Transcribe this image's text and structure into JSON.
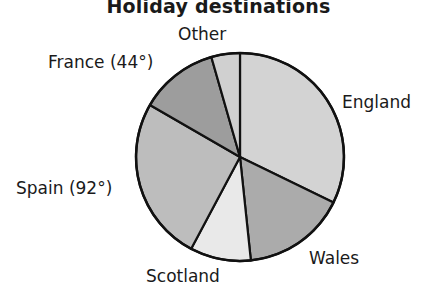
{
  "chart_data": {
    "type": "pie",
    "title": "Holiday destinations",
    "start_angle_deg": 0,
    "direction": "clockwise",
    "slices": [
      {
        "label": "England",
        "display": "England",
        "degrees": 116,
        "color": "#d3d3d3"
      },
      {
        "label": "Wales",
        "display": "Wales",
        "degrees": 58,
        "color": "#ababab"
      },
      {
        "label": "Scotland",
        "display": "Scotland",
        "degrees": 34,
        "color": "#e9e9e9"
      },
      {
        "label": "Spain",
        "display": "Spain (92°)",
        "degrees": 92,
        "color": "#bdbdbd"
      },
      {
        "label": "France",
        "display": "France (44°)",
        "degrees": 44,
        "color": "#9d9d9d"
      },
      {
        "label": "Other",
        "display": "Other",
        "degrees": 16,
        "color": "#d0d0d0"
      }
    ],
    "annotations": [
      "Spain (92°)",
      "France (44°)"
    ],
    "legend": "none (labels placed around pie)"
  },
  "labels": {
    "england": "England",
    "wales": "Wales",
    "scotland": "Scotland",
    "spain": "Spain (92°)",
    "france": "France (44°)",
    "other": "Other"
  }
}
